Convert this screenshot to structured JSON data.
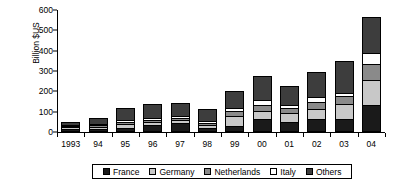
{
  "chart_data": {
    "type": "bar",
    "subtype": "stacked-bar",
    "title": "",
    "xlabel": "",
    "ylabel": "Billion $US",
    "ylim": [
      0,
      600
    ],
    "yticks": [
      0,
      100,
      200,
      300,
      400,
      500,
      600
    ],
    "ytick_labels": [
      "0",
      "100",
      "200",
      "300",
      "400",
      "500",
      "600"
    ],
    "grid": false,
    "legend_position": "bottom",
    "categories": [
      "1993",
      "94",
      "95",
      "96",
      "97",
      "98",
      "99",
      "00",
      "01",
      "02",
      "03",
      "04"
    ],
    "series": [
      {
        "name": "France",
        "color": "#1a1a1a",
        "values": [
          13,
          14,
          22,
          33,
          46,
          22,
          32,
          65,
          50,
          66,
          66,
          135
        ]
      },
      {
        "name": "Germany",
        "color": "#c8c8c8",
        "values": [
          10,
          9,
          19,
          14,
          12,
          12,
          45,
          40,
          42,
          48,
          72,
          120
        ]
      },
      {
        "name": "Netherlands",
        "color": "#8a8a8a",
        "values": [
          8,
          10,
          10,
          12,
          13,
          11,
          25,
          30,
          25,
          35,
          37,
          80
        ]
      },
      {
        "name": "Italy",
        "color": "#ffffff",
        "values": [
          5,
          6,
          8,
          9,
          10,
          8,
          16,
          25,
          17,
          21,
          19,
          55
        ]
      },
      {
        "name": "Others",
        "color": "#3d3d3d",
        "values": [
          12,
          29,
          61,
          69,
          61,
          59,
          85,
          115,
          94,
          124,
          156,
          175
        ]
      }
    ],
    "totals": [
      48,
      68,
      120,
      137,
      142,
      112,
      203,
      275,
      228,
      294,
      350,
      565
    ]
  }
}
